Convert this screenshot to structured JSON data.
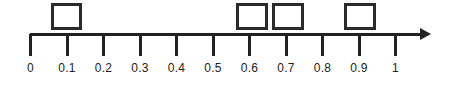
{
  "worksheet": {
    "type": "number-line",
    "width": 451,
    "height": 90,
    "line_color": "#222222",
    "box_color": "#2a2a2a",
    "background": "#ffffff"
  },
  "number_line": {
    "min": 0,
    "max": 1,
    "step": 0.1,
    "start_x": 30,
    "end_x": 426,
    "tick_spacing": 36.5,
    "axis_y": 33,
    "has_arrow_end": true,
    "ticks": [
      {
        "label": "0",
        "value": 0,
        "x": 30
      },
      {
        "label": "0.1",
        "value": 0.1,
        "x": 66.5
      },
      {
        "label": "0.2",
        "value": 0.2,
        "x": 103
      },
      {
        "label": "0.3",
        "value": 0.3,
        "x": 139.5
      },
      {
        "label": "0.4",
        "value": 0.4,
        "x": 176
      },
      {
        "label": "0.5",
        "value": 0.5,
        "x": 212.5
      },
      {
        "label": "0.6",
        "value": 0.6,
        "x": 249
      },
      {
        "label": "0.7",
        "value": 0.7,
        "x": 285.5
      },
      {
        "label": "0.8",
        "value": 0.8,
        "x": 322
      },
      {
        "label": "0.9",
        "value": 0.9,
        "x": 358.5
      },
      {
        "label": "1",
        "value": 1,
        "x": 395
      }
    ]
  },
  "answer_boxes": [
    {
      "name": "answer-box-1",
      "value": "",
      "x": 51,
      "y": 3,
      "width": 31,
      "height": 27
    },
    {
      "name": "answer-box-2",
      "value": "",
      "x": 236,
      "y": 3,
      "width": 32,
      "height": 27
    },
    {
      "name": "answer-box-3",
      "value": "",
      "x": 272,
      "y": 3,
      "width": 32,
      "height": 27
    },
    {
      "name": "answer-box-4",
      "value": "",
      "x": 344,
      "y": 3,
      "width": 32,
      "height": 27
    }
  ]
}
